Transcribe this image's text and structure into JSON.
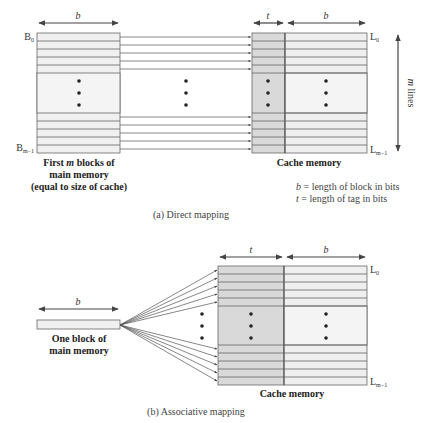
{
  "colors": {
    "line": "#555555",
    "tag_fill": "#d9d9d9",
    "data_fill": "#efefef",
    "block_fill": "#f0f0f0",
    "mid_fill": "#f4f4f4",
    "text": "#333333"
  },
  "part_a": {
    "caption": "(a) Direct mapping",
    "main_memory": {
      "width_label": "b",
      "first_block_label": "B",
      "first_block_sub": "0",
      "last_block_label": "B",
      "last_block_sub": "m−1",
      "caption_line1_pre": "First ",
      "caption_line1_var": "m",
      "caption_line1_post": " blocks of",
      "caption_line2": "main memory",
      "caption_line3": "(equal to size of cache)"
    },
    "cache": {
      "tag_width_label": "t",
      "data_width_label": "b",
      "first_line_label": "L",
      "first_line_sub": "0",
      "last_line_label": "L",
      "last_line_sub": "m−1",
      "caption": "Cache memory",
      "height_label_var": "m",
      "height_label_text": " lines"
    },
    "legend": {
      "b_var": "b",
      "b_text": " = length of block in bits",
      "t_var": "t",
      "t_text": " = length of tag in bits"
    }
  },
  "part_b": {
    "caption": "(b) Associative mapping",
    "block": {
      "width_label": "b",
      "caption_line1": "One block of",
      "caption_line2": "main memory"
    },
    "cache": {
      "tag_width_label": "t",
      "data_width_label": "b",
      "first_line_label": "L",
      "first_line_sub": "0",
      "last_line_label": "L",
      "last_line_sub": "m−1",
      "caption": "Cache memory"
    }
  }
}
